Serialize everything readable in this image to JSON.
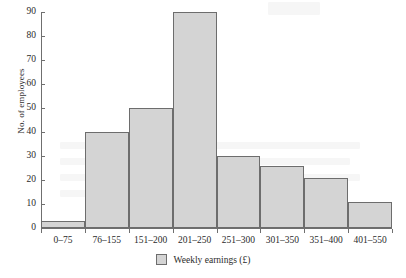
{
  "chart_data": {
    "type": "bar",
    "title": "",
    "xlabel": "Weekly earnings (£)",
    "ylabel": "No. of employees",
    "categories": [
      "0–75",
      "76–155",
      "151–200",
      "201–250",
      "251–300",
      "301–350",
      "351–400",
      "401–550"
    ],
    "values": [
      3,
      40,
      50,
      90,
      30,
      26,
      21,
      11
    ],
    "ylim": [
      0,
      90
    ],
    "ytick_values": [
      0,
      10,
      20,
      30,
      40,
      50,
      60,
      70,
      80,
      90
    ],
    "ytick_labels": [
      "0",
      "10",
      "20",
      "30",
      "40",
      "50",
      "60",
      "70",
      "80",
      "90"
    ],
    "grid": false,
    "legend_position": "bottom",
    "legend": [
      {
        "label": "Weekly earnings (£)",
        "color": "#d4d4d4"
      }
    ],
    "series": [
      {
        "name": "Weekly earnings (£)",
        "values": [
          3,
          40,
          50,
          90,
          30,
          26,
          21,
          11
        ]
      }
    ]
  },
  "style": {
    "bar_fill": "#d4d4d4",
    "bar_border": "#6d6d6d",
    "axis_color": "#6f6f6f",
    "text_color": "#2b2b2b",
    "background": "#ffffff"
  }
}
